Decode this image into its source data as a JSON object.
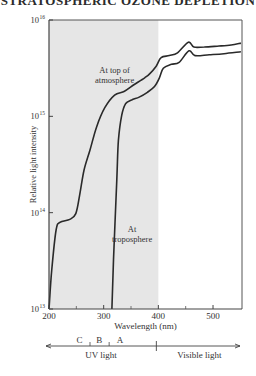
{
  "page_title": "STRATOSPHERIC OZONE DEPLETION",
  "chart_data": {
    "type": "line",
    "title": "",
    "xlabel": "Wavelength (nm)",
    "ylabel": "Relative light intensity",
    "xlim": [
      200,
      553
    ],
    "ylim_log10": [
      13,
      16
    ],
    "yscale": "log",
    "x_ticks": [
      200,
      300,
      400,
      500
    ],
    "x_minor_ticks": [
      250,
      350,
      450
    ],
    "y_ticks": [
      {
        "exp": 16,
        "label": "10",
        "sup": "16"
      },
      {
        "exp": 15,
        "label": "10",
        "sup": "15"
      },
      {
        "exp": 14,
        "label": "10",
        "sup": "14"
      },
      {
        "exp": 13,
        "label": "10",
        "sup": "13"
      }
    ],
    "shaded_region": {
      "x_from": 200,
      "x_to": 400,
      "color": "#e6e6e6"
    },
    "grid": false,
    "legend": "none",
    "series": [
      {
        "name": "At top of atmosphere",
        "label_lines": [
          "At top of",
          "atmosphere"
        ],
        "label_at": {
          "x": 320,
          "log10y": 15.45
        },
        "x": [
          200,
          205,
          213,
          220,
          238,
          249,
          256,
          264,
          275,
          287,
          302,
          320,
          338,
          356,
          375,
          384,
          396,
          405,
          420,
          435,
          455,
          465,
          484,
          511,
          533,
          551
        ],
        "log10y": [
          13.0,
          13.4,
          13.82,
          13.9,
          13.93,
          13.99,
          14.18,
          14.44,
          14.65,
          14.89,
          15.09,
          15.22,
          15.26,
          15.33,
          15.4,
          15.44,
          15.52,
          15.61,
          15.63,
          15.66,
          15.77,
          15.72,
          15.72,
          15.73,
          15.74,
          15.76
        ]
      },
      {
        "name": "At troposphere",
        "label_lines": [
          "At",
          "troposphere"
        ],
        "label_at": {
          "x": 352,
          "log10y": 13.8
        },
        "x": [
          315,
          318,
          324,
          327,
          333,
          340,
          351,
          365,
          380,
          393,
          402,
          409,
          424,
          438,
          456,
          467,
          493,
          520,
          551
        ],
        "log10y": [
          13.0,
          13.51,
          14.34,
          14.75,
          15.01,
          15.13,
          15.17,
          15.2,
          15.25,
          15.31,
          15.4,
          15.5,
          15.54,
          15.56,
          15.68,
          15.63,
          15.64,
          15.65,
          15.67
        ]
      }
    ],
    "spectrum_bar": {
      "uv_bands": [
        {
          "label": "C",
          "x": 256
        },
        {
          "label": "B",
          "x": 292
        },
        {
          "label": "A",
          "x": 330
        }
      ],
      "band_dividers": [
        275,
        310
      ],
      "uv_label": "UV light",
      "visible_label": "Visible light",
      "uv_visible_boundary": 400
    }
  }
}
